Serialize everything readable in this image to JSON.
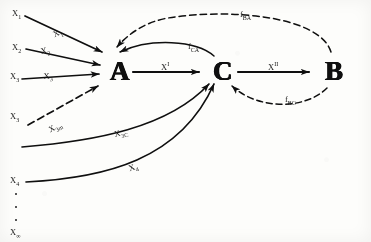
{
  "figure": {
    "type": "causal-block-diagram",
    "background_color": "#fdfdfb",
    "ink_color": "#111111"
  },
  "nodes": [
    {
      "id": "A",
      "label": "A",
      "x": 112,
      "y": 63
    },
    {
      "id": "C",
      "label": "C",
      "x": 215,
      "y": 63
    },
    {
      "id": "B",
      "label": "B",
      "x": 327,
      "y": 63
    }
  ],
  "inputs": [
    {
      "id": "x1",
      "label": "X",
      "sub": "1"
    },
    {
      "id": "x2",
      "label": "X",
      "sub": "2"
    },
    {
      "id": "x3a",
      "label": "X",
      "sub": "3"
    },
    {
      "id": "x3b",
      "label": "X",
      "sub": "3"
    },
    {
      "id": "x4",
      "label": "X",
      "sub": "4"
    },
    {
      "id": "xinf",
      "label": "X",
      "sub": "∞"
    }
  ],
  "edge_labels": {
    "x1_in": {
      "label": "X",
      "sub": "1"
    },
    "x2_in": {
      "label": "X",
      "sub": "2"
    },
    "x3_in": {
      "label": "X",
      "sub": "3"
    },
    "x3m_in": {
      "label": "X",
      "sub": "3m"
    },
    "x3c_in": {
      "label": "X",
      "sub": "3C"
    },
    "x4_in": {
      "label": "X",
      "sub": "4"
    },
    "a_to_c": {
      "label": "X",
      "sup": "I"
    },
    "c_to_b": {
      "label": "X",
      "sup": "II"
    },
    "f_ca": {
      "label": "f",
      "sub": "CA"
    },
    "f_ba": {
      "label": "f",
      "sub": "BA"
    },
    "f_bc": {
      "label": "f",
      "sub": "BC"
    }
  },
  "ellipsis": {
    "count": 3,
    "glyph": "·"
  }
}
